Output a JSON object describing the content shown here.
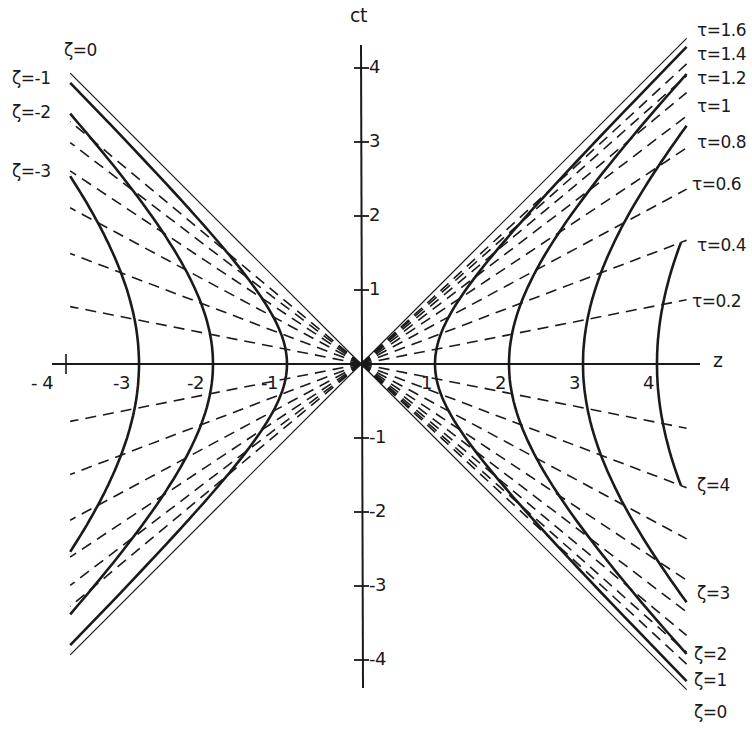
{
  "chart_data": {
    "type": "line",
    "title": "",
    "xlabel": "z",
    "ylabel": "ct",
    "origin_px": [
      361,
      364
    ],
    "unit_px": 74,
    "xlim": [
      -3.93,
      4.4
    ],
    "ylim": [
      -4.4,
      4.3
    ],
    "x_ticks": [
      -4,
      -3,
      -2,
      -1,
      1,
      2,
      3,
      4
    ],
    "y_ticks": [
      -4,
      -3,
      -2,
      -1,
      1,
      2,
      3,
      4
    ],
    "x_tick_labels": [
      "- 4",
      "-3",
      "-2",
      "-1",
      "1",
      "2",
      "3",
      "4"
    ],
    "y_tick_labels": [
      "-4",
      "-3",
      "-2",
      "-1",
      "1",
      "2",
      "3",
      "4"
    ],
    "light_cone": "ct = ±z (thin solid, ζ=0)",
    "hyperbolas_zeta": {
      "description": "constant ζ: z² - (ct)² = ζ² (thick solid)",
      "right": [
        1,
        2,
        3,
        4
      ],
      "left": [
        -1,
        -2,
        -3
      ],
      "zeta4_tau_range": [
        -0.4,
        0.4
      ]
    },
    "rays_tau": {
      "description": "constant τ: ct = z·tanh τ (dashed)",
      "values": [
        0.2,
        0.4,
        0.6,
        0.8,
        1.0,
        1.2,
        1.4,
        1.6,
        -0.2,
        -0.4,
        -0.6,
        -0.8,
        -1.0,
        -1.2,
        -1.4,
        -1.6
      ]
    }
  },
  "axes": {
    "z_label": "z",
    "ct_label": "ct"
  },
  "labels_tau": [
    {
      "text": "τ=1.6",
      "x": 697,
      "y": 22
    },
    {
      "text": "τ=1.4",
      "x": 697,
      "y": 46
    },
    {
      "text": "τ=1.2",
      "x": 697,
      "y": 70
    },
    {
      "text": "τ=1",
      "x": 697,
      "y": 98
    },
    {
      "text": "τ=0.8",
      "x": 697,
      "y": 134
    },
    {
      "text": "τ=0.6",
      "x": 692,
      "y": 176
    },
    {
      "text": "τ=0.4",
      "x": 697,
      "y": 237
    },
    {
      "text": "τ=0.2",
      "x": 692,
      "y": 293
    }
  ],
  "labels_zeta_right": [
    {
      "text": "ζ=4",
      "x": 697,
      "y": 477
    },
    {
      "text": "ζ=3",
      "x": 697,
      "y": 585
    },
    {
      "text": "ζ=2",
      "x": 694,
      "y": 646
    },
    {
      "text": "ζ=1",
      "x": 694,
      "y": 672
    },
    {
      "text": "ζ=0",
      "x": 694,
      "y": 704
    }
  ],
  "labels_zeta_left": [
    {
      "text": "ζ=0",
      "x": 64,
      "y": 42
    },
    {
      "text": "ζ=-1",
      "x": 12,
      "y": 70
    },
    {
      "text": "ζ=-2",
      "x": 12,
      "y": 104
    },
    {
      "text": "ζ=-3",
      "x": 12,
      "y": 163
    }
  ],
  "colors": {
    "ink": "#1a1a1a",
    "background": "#ffffff"
  }
}
